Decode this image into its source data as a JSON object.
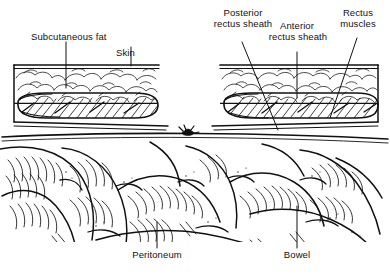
{
  "figure": {
    "type": "medical-line-illustration",
    "title_visible": false,
    "ink_color": "#111111",
    "background_color": "#ffffff"
  },
  "labels": {
    "subcutaneous_fat": "Subcutaneous fat",
    "skin": "Skin",
    "posterior_rectus_sheath_line1": "Posterior",
    "posterior_rectus_sheath_line2": "rectus sheath",
    "anterior_rectus_sheath_line1": "Anterior",
    "anterior_rectus_sheath_line2": "rectus sheath",
    "rectus_muscles_line1": "Rectus",
    "rectus_muscles_line2": "muscles",
    "peritoneum": "Peritoneum",
    "bowel": "Bowel"
  },
  "structures": [
    {
      "name": "skin",
      "side": "both",
      "description": "outer boundary line of abdominal wall block"
    },
    {
      "name": "subcutaneous-fat",
      "side": "both",
      "description": "bubbly adipose lobule texture layer"
    },
    {
      "name": "anterior-rectus-sheath",
      "side": "both",
      "description": "line bounding top of rectus muscle oval"
    },
    {
      "name": "rectus-muscle",
      "side": "both",
      "description": "hatched elongated oval muscle belly"
    },
    {
      "name": "posterior-rectus-sheath",
      "side": "both",
      "description": "line bounding bottom of rectus muscle oval"
    },
    {
      "name": "peritoneum",
      "side": "center",
      "description": "horizontal membrane line across mid-figure"
    },
    {
      "name": "suture-knot",
      "side": "center",
      "description": "small dark knot marker on peritoneal line"
    },
    {
      "name": "bowel",
      "side": "lower",
      "description": "coiled intestinal loops with haustral hatching"
    }
  ]
}
